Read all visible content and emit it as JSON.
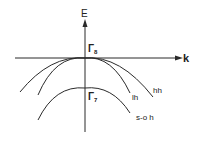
{
  "diagram": {
    "type": "band-structure",
    "axes": {
      "vertical_label": "E",
      "horizontal_label": "k"
    },
    "points": {
      "gamma8": {
        "symbol": "Γ",
        "subscript": "8"
      },
      "gamma7": {
        "symbol": "Γ",
        "subscript": "7"
      }
    },
    "bands": [
      {
        "id": "hh",
        "label": "hh",
        "name": "heavy hole"
      },
      {
        "id": "lh",
        "label": "lh",
        "name": "light hole"
      },
      {
        "id": "so",
        "label": "s-o h",
        "name": "split-off hole"
      }
    ],
    "colors": {
      "line": "#2a2a2a",
      "background": "#ffffff"
    }
  }
}
